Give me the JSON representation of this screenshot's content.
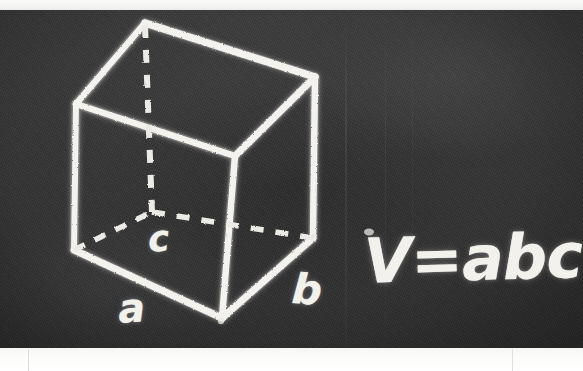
{
  "scene": {
    "medium": "chalkboard-photo",
    "board_color": "#383838",
    "chalk_color": "#f2f1ec",
    "frame_color": "#ffffff"
  },
  "drawing": {
    "name": "rectangular-box-volume-diagram",
    "solid_edges": [
      {
        "name": "top-back-to-top-left",
        "x1": 145,
        "y1": 23,
        "x2": 76,
        "y2": 104
      },
      {
        "name": "top-back-to-top-right",
        "x1": 145,
        "y1": 23,
        "x2": 315,
        "y2": 77
      },
      {
        "name": "top-left-to-top-front",
        "x1": 76,
        "y1": 104,
        "x2": 235,
        "y2": 156
      },
      {
        "name": "top-right-to-top-front",
        "x1": 315,
        "y1": 77,
        "x2": 235,
        "y2": 156
      },
      {
        "name": "left-vertical-edge",
        "x1": 76,
        "y1": 104,
        "x2": 74,
        "y2": 250
      },
      {
        "name": "front-vertical-edge",
        "x1": 235,
        "y1": 156,
        "x2": 222,
        "y2": 318
      },
      {
        "name": "right-vertical-edge",
        "x1": 315,
        "y1": 77,
        "x2": 313,
        "y2": 238
      },
      {
        "name": "bottom-left-to-bottom-front",
        "x1": 74,
        "y1": 250,
        "x2": 222,
        "y2": 318
      },
      {
        "name": "bottom-front-to-bottom-right",
        "x1": 222,
        "y1": 318,
        "x2": 313,
        "y2": 238
      }
    ],
    "hidden_edges": [
      {
        "name": "hidden-vertical-edge",
        "x1": 145,
        "y1": 25,
        "x2": 152,
        "y2": 212
      },
      {
        "name": "hidden-bottom-left-edge",
        "x1": 74,
        "y1": 250,
        "x2": 152,
        "y2": 212
      },
      {
        "name": "hidden-bottom-right-edge",
        "x1": 152,
        "y1": 212,
        "x2": 313,
        "y2": 238
      }
    ],
    "labels": {
      "depth": "c",
      "width": "a",
      "length": "b"
    }
  },
  "formula": {
    "text": "V=abc",
    "meaning": "volume-equals-a-times-b-times-c"
  },
  "frame": {
    "tick_marks": [
      "left-tick",
      "right-tick"
    ]
  }
}
